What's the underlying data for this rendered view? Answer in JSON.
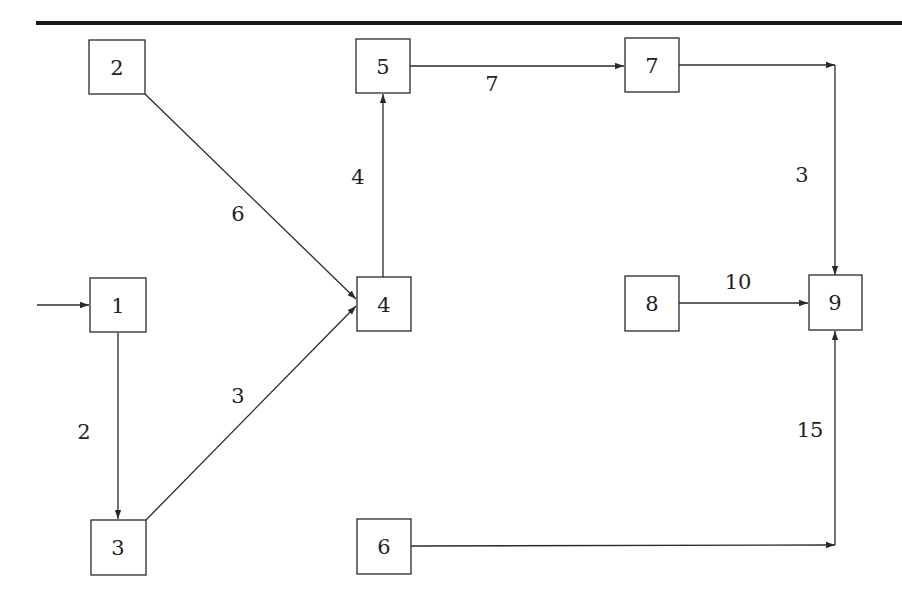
{
  "diagram": {
    "type": "directed-network",
    "colors": {
      "stroke": "#2a2a2a",
      "text": "#222222",
      "background": "#ffffff"
    },
    "nodes": [
      {
        "id": "1",
        "label": "1"
      },
      {
        "id": "2",
        "label": "2"
      },
      {
        "id": "3",
        "label": "3"
      },
      {
        "id": "4",
        "label": "4"
      },
      {
        "id": "5",
        "label": "5"
      },
      {
        "id": "6",
        "label": "6"
      },
      {
        "id": "7",
        "label": "7"
      },
      {
        "id": "8",
        "label": "8"
      },
      {
        "id": "9",
        "label": "9"
      }
    ],
    "edges": [
      {
        "from": "source",
        "to": "1",
        "label": ""
      },
      {
        "from": "1",
        "to": "3",
        "label": "2"
      },
      {
        "from": "2",
        "to": "4",
        "label": "6"
      },
      {
        "from": "3",
        "to": "4",
        "label": "3"
      },
      {
        "from": "4",
        "to": "5",
        "label": "4"
      },
      {
        "from": "5",
        "to": "7",
        "label": "7"
      },
      {
        "from": "7",
        "to": "9",
        "label": "3"
      },
      {
        "from": "8",
        "to": "9",
        "label": "10"
      },
      {
        "from": "6",
        "to": "9",
        "label": "15"
      }
    ]
  }
}
